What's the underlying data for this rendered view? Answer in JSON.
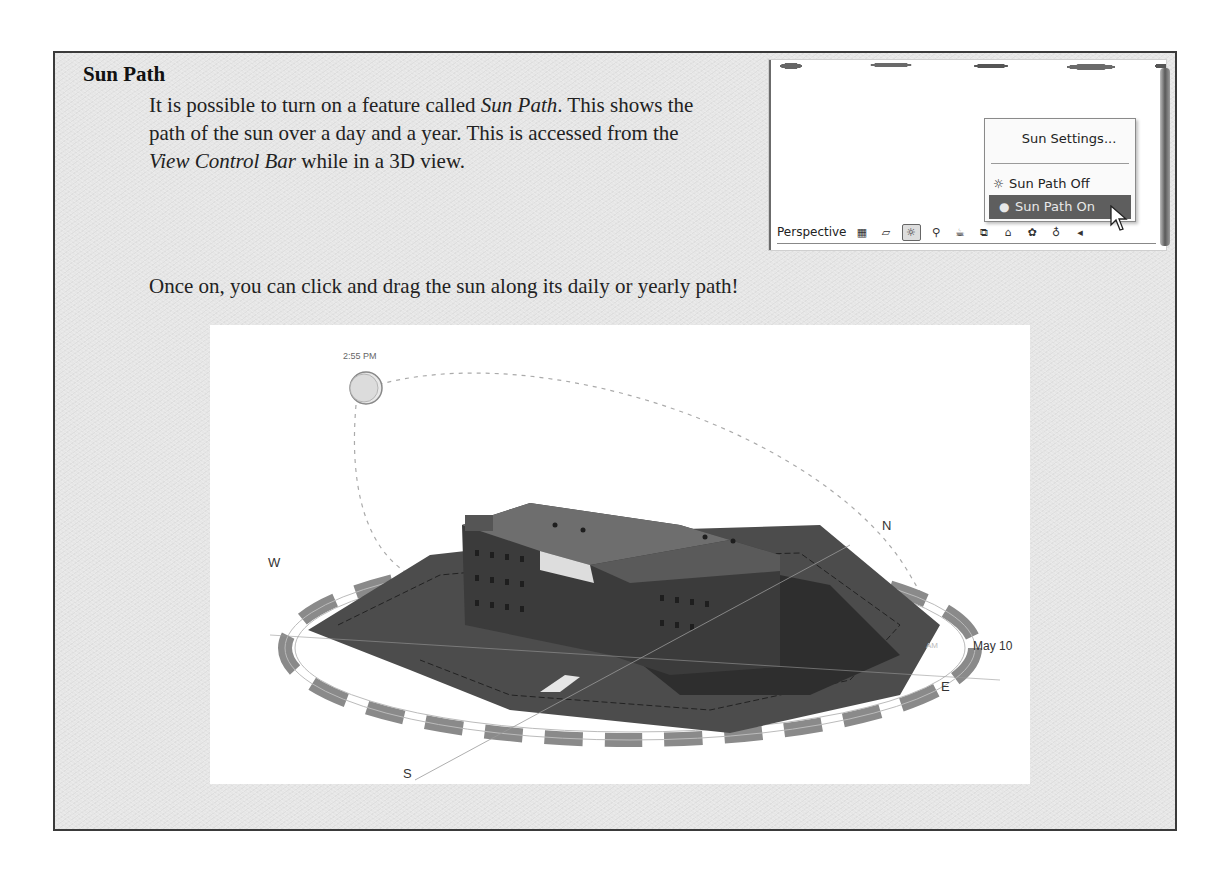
{
  "section": {
    "heading": "Sun Path",
    "paragraph": {
      "t1": "It is possible to turn on a feature called ",
      "em1": "Sun Path",
      "t2": ". This shows the path of the sun over a day and a year. This is accessed from the ",
      "em2": "View Control Bar",
      "t3": " while in a 3D view."
    },
    "paragraph2": "Once on, you can click and drag the sun along its daily or yearly path!"
  },
  "inset": {
    "menu": {
      "items": [
        {
          "label": "Sun Settings...",
          "icon": ""
        },
        {
          "label": "Sun Path Off",
          "icon": "sun-off-icon"
        },
        {
          "label": "Sun Path On",
          "icon": "bullet-icon",
          "highlighted": true
        }
      ]
    },
    "view_control_bar": {
      "label": "Perspective",
      "icons": [
        "visual-style-icon",
        "3d-box-icon",
        "sun-path-icon",
        "shadows-off-icon",
        "show-rendering-icon",
        "crop-view-icon",
        "lock-3d-view-icon",
        "temporary-hide-icon",
        "lightbulb-icon",
        "scroll-left-icon"
      ]
    }
  },
  "figure": {
    "time_label": "2:55 PM",
    "date_label": "May 10",
    "am_label": "AM",
    "compass": {
      "north": "N",
      "south": "S",
      "east": "E",
      "west": "W"
    },
    "colors": {
      "ground": "#4a4a4a",
      "building": "#3a3a3a",
      "roof": "#6e6e6e",
      "ring_dark": "#777777"
    }
  }
}
